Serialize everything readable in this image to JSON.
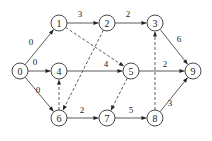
{
  "diagram": {
    "type": "directed-network",
    "nodes": [
      {
        "id": "0",
        "label": "0",
        "x": 20,
        "y": 71
      },
      {
        "id": "1",
        "label": "1",
        "x": 59,
        "y": 23
      },
      {
        "id": "2",
        "label": "2",
        "x": 107,
        "y": 23
      },
      {
        "id": "3",
        "label": "3",
        "x": 155,
        "y": 23
      },
      {
        "id": "4",
        "label": "4",
        "x": 59,
        "y": 71
      },
      {
        "id": "5",
        "label": "5",
        "x": 131,
        "y": 71
      },
      {
        "id": "6",
        "label": "6",
        "x": 59,
        "y": 118
      },
      {
        "id": "7",
        "label": "7",
        "x": 107,
        "y": 118
      },
      {
        "id": "8",
        "label": "8",
        "x": 155,
        "y": 118
      },
      {
        "id": "9",
        "label": "9",
        "x": 193,
        "y": 71
      }
    ],
    "edges": [
      {
        "from": "0",
        "to": "1",
        "weight": "0",
        "style": "solid",
        "lx": 31,
        "ly": 45
      },
      {
        "from": "0",
        "to": "4",
        "weight": "0",
        "style": "solid",
        "lx": 35,
        "ly": 65
      },
      {
        "from": "0",
        "to": "6",
        "weight": "0",
        "style": "solid",
        "lx": 38,
        "ly": 93
      },
      {
        "from": "1",
        "to": "2",
        "weight": "3",
        "style": "solid",
        "lx": 80,
        "ly": 17
      },
      {
        "from": "2",
        "to": "3",
        "weight": "2",
        "style": "solid",
        "lx": 128,
        "ly": 17
      },
      {
        "from": "3",
        "to": "9",
        "weight": "6",
        "style": "solid",
        "lx": 179,
        "ly": 42
      },
      {
        "from": "4",
        "to": "5",
        "weight": "4",
        "style": "solid",
        "lx": 106,
        "ly": 67
      },
      {
        "from": "5",
        "to": "9",
        "weight": "2",
        "style": "solid",
        "lx": 165,
        "ly": 67
      },
      {
        "from": "6",
        "to": "7",
        "weight": "2",
        "style": "solid",
        "lx": 82,
        "ly": 113
      },
      {
        "from": "7",
        "to": "8",
        "weight": "5",
        "style": "solid",
        "lx": 131,
        "ly": 113
      },
      {
        "from": "8",
        "to": "9",
        "weight": "3",
        "style": "solid",
        "lx": 170,
        "ly": 106
      },
      {
        "from": "1",
        "to": "5",
        "weight": "",
        "style": "dashed"
      },
      {
        "from": "2",
        "to": "6",
        "weight": "",
        "style": "dashed"
      },
      {
        "from": "6",
        "to": "4",
        "weight": "",
        "style": "dashed"
      },
      {
        "from": "5",
        "to": "7",
        "weight": "",
        "style": "dashed"
      },
      {
        "from": "8",
        "to": "3",
        "weight": "",
        "style": "dashed"
      }
    ],
    "node_radius": 8,
    "colors": {
      "stroke": "#333333",
      "background": "#ffffff"
    }
  }
}
